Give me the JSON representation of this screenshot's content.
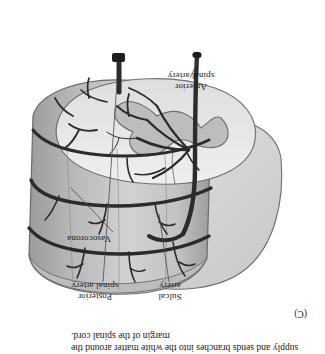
{
  "figure": {
    "panel_letter": "(C)",
    "orientation_note": "rotated-180",
    "caption": "supply and sends branches into the white matter around the margin of the spinal cord.",
    "labels": {
      "anterior_spinal_artery": "Anterior\nspinal artery",
      "vasocorona": "Vasocorona",
      "sulcal_artery": "Sulcal\nartery",
      "posterior_spinal_artery": "Posterior\nspinal artery"
    },
    "colors": {
      "background": "#ffffff",
      "cord_surface_light": "#cfcfcf",
      "cord_surface_mid": "#b4b4b4",
      "cord_surface_dark": "#9a9a9a",
      "white_matter": "#e9e9e9",
      "gray_matter": "#bdbdbd",
      "vessel": "#2b2b2b",
      "outline": "#5a5a5a",
      "text": "#1d1d1d",
      "leader_line": "#4a4a4a"
    }
  }
}
